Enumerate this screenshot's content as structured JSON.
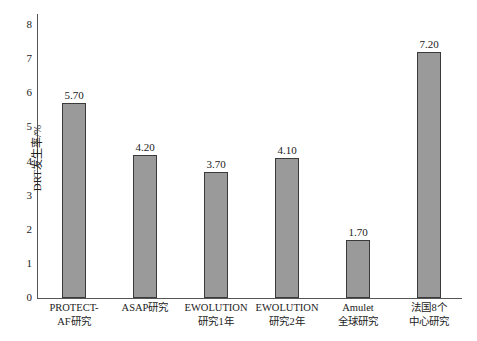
{
  "chart_data": {
    "type": "bar",
    "title": "",
    "xlabel": "",
    "ylabel": "DRT发生率/%",
    "ylim": [
      0,
      8
    ],
    "yticks": [
      "0",
      "1",
      "2",
      "3",
      "4",
      "5",
      "6",
      "7",
      "8"
    ],
    "grid": false,
    "legend": null,
    "categories": [
      [
        "PROTECT-",
        "AF研究"
      ],
      [
        "ASAP研究",
        ""
      ],
      [
        "EWOLUTION",
        "研究1年"
      ],
      [
        "EWOLUTION",
        "研究2年"
      ],
      [
        "Amulet",
        "全球研究"
      ],
      [
        "法国8个",
        "中心研究"
      ]
    ],
    "values": [
      5.7,
      4.2,
      3.7,
      4.1,
      1.7,
      7.2
    ],
    "value_labels": [
      "5.70",
      "4.20",
      "3.70",
      "4.10",
      "1.70",
      "7.20"
    ],
    "bar_color": "#9a9a9a",
    "bar_edge_color": "#3a3a3a"
  }
}
